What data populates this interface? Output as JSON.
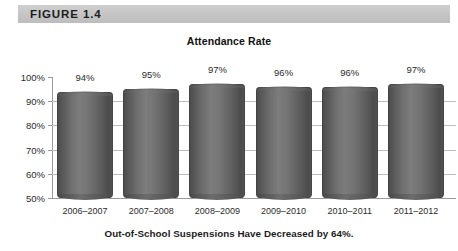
{
  "figure": {
    "header_label": "FIGURE 1.4",
    "header_color": "#c6c6c6",
    "caption": "Out-of-School Suspensions Have Decreased by 64%."
  },
  "chart_data": {
    "type": "bar",
    "title": "Attendance Rate",
    "xlabel": "",
    "ylabel": "",
    "ylim": [
      50,
      100
    ],
    "grid": true,
    "legend": "none",
    "categories": [
      "2006–2007",
      "2007–2008",
      "2008–2009",
      "2009–2010",
      "2010–2011",
      "2011–2012"
    ],
    "values": [
      94,
      95,
      97,
      96,
      96,
      97
    ],
    "value_labels": [
      "94%",
      "95%",
      "97%",
      "96%",
      "96%",
      "97%"
    ],
    "ytick_labels": [
      "100%",
      "90%",
      "80%",
      "70%",
      "60%",
      "50%"
    ],
    "ytick_values": [
      100,
      90,
      80,
      70,
      60,
      50
    ],
    "bar_color": "#6e6e6e",
    "axis_color": "#9a9a9a"
  }
}
